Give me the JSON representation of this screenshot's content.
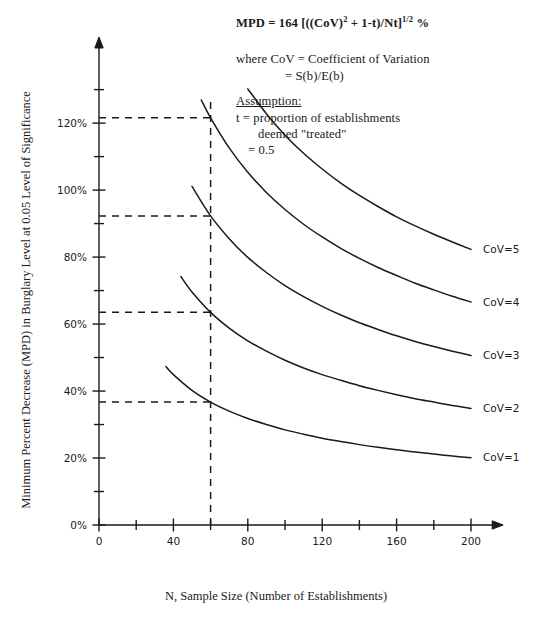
{
  "chart_data": {
    "type": "line",
    "title": "",
    "xlabel": "N, Sample Size (Number of Establishments)",
    "ylabel": "Minimum Percent Decrease (MPD) in Burglary Level at 0.05 Level of Significance",
    "xlim": [
      0,
      215
    ],
    "ylim": [
      0,
      135
    ],
    "grid": false,
    "legend_position": "inline-right-of-curves",
    "x_ticks": [
      0,
      40,
      80,
      120,
      160,
      200
    ],
    "x_tick_labels": [
      "0",
      "40",
      "80",
      "120",
      "160",
      "200"
    ],
    "x_minor_ticks": [
      20,
      60,
      100,
      140,
      180
    ],
    "y_ticks": [
      0,
      20,
      40,
      60,
      80,
      100,
      120
    ],
    "y_tick_labels": [
      "0%",
      "20%",
      "40%",
      "60%",
      "80%",
      "100%",
      "120%"
    ],
    "y_minor_ticks": [
      10,
      30,
      50,
      70,
      90,
      110,
      130
    ],
    "formula": "MPD = 164 * sqrt((CoV^2 + 1 - t) / (N * t))",
    "t_value": 0.5,
    "series": [
      {
        "name": "CoV=1",
        "label": "CoV=1",
        "x": [
          36,
          40,
          50,
          60,
          70,
          80,
          90,
          100,
          110,
          120,
          130,
          140,
          150,
          160,
          170,
          180,
          190,
          200
        ],
        "values": [
          47.3,
          44.9,
          40.2,
          36.7,
          34.0,
          31.8,
          30.0,
          28.4,
          27.1,
          25.9,
          24.9,
          24.0,
          23.2,
          22.5,
          21.8,
          21.2,
          20.6,
          20.1
        ],
        "label_x": 200,
        "label_y": 20.1
      },
      {
        "name": "CoV=2",
        "label": "CoV=2",
        "x": [
          44,
          50,
          60,
          70,
          80,
          90,
          100,
          110,
          120,
          130,
          140,
          150,
          160,
          170,
          180,
          190,
          200
        ],
        "values": [
          74.2,
          69.6,
          63.5,
          58.8,
          55.0,
          51.9,
          49.2,
          46.9,
          44.9,
          43.2,
          41.6,
          40.2,
          38.9,
          37.7,
          36.7,
          35.7,
          34.8
        ],
        "label_x": 200,
        "label_y": 34.8
      },
      {
        "name": "CoV=3",
        "label": "CoV=3",
        "x": [
          50,
          60,
          70,
          80,
          90,
          100,
          110,
          120,
          130,
          140,
          150,
          160,
          170,
          180,
          190,
          200
        ],
        "values": [
          101.1,
          92.3,
          85.5,
          79.9,
          75.4,
          71.5,
          68.2,
          65.3,
          62.7,
          60.4,
          58.4,
          56.5,
          54.8,
          53.3,
          51.9,
          50.6
        ],
        "label_x": 200,
        "label_y": 50.6
      },
      {
        "name": "CoV=4",
        "label": "CoV=4",
        "x": [
          55,
          60,
          70,
          80,
          90,
          100,
          110,
          120,
          130,
          140,
          150,
          160,
          170,
          180,
          190,
          200
        ],
        "values": [
          126.9,
          121.6,
          112.6,
          105.3,
          99.3,
          94.2,
          89.8,
          86.0,
          82.6,
          79.6,
          76.9,
          74.5,
          72.2,
          70.2,
          68.3,
          66.6
        ],
        "label_x": 200,
        "label_y": 66.6
      },
      {
        "name": "CoV=5",
        "label": "CoV=5",
        "x": [
          80,
          90,
          100,
          110,
          120,
          130,
          140,
          150,
          160,
          170,
          180,
          190,
          200
        ],
        "values": [
          130.2,
          122.8,
          116.4,
          111.0,
          106.3,
          102.1,
          98.4,
          95.1,
          92.0,
          89.3,
          86.8,
          84.5,
          82.3
        ],
        "label_x": 200,
        "label_y": 82.3
      }
    ],
    "annotations": {
      "vertical_reference": {
        "x": 60,
        "y_from": 0,
        "y_to": 127
      },
      "horizontal_references": [
        {
          "y": 121.6,
          "x_from": 0,
          "x_to": 60,
          "series": "CoV=4"
        },
        {
          "y": 92.3,
          "x_from": 0,
          "x_to": 60,
          "series": "CoV=3"
        },
        {
          "y": 63.5,
          "x_from": 0,
          "x_to": 60,
          "series": "CoV=2"
        },
        {
          "y": 36.7,
          "x_from": 0,
          "x_to": 60,
          "series": "CoV=1"
        }
      ]
    }
  },
  "notes": {
    "formula_lhs": "MPD",
    "formula_eq": "=",
    "formula_rhs_a": "164 [((CoV)",
    "formula_sup2": "2",
    "formula_rhs_b": " + 1-t)/Nt]",
    "formula_sup_half": "1/2",
    "formula_percent": "%",
    "cov_definition": "where CoV  =  Coefficient of Variation",
    "cov_definition_2": "=  S(b)/E(b)",
    "assumption_title": "Assumption:",
    "assumption_line1": "t  =  proportion of establishments",
    "assumption_line2": "deemed \"treated\"",
    "assumption_line3": "=  0.5"
  },
  "axis": {
    "x_title": "N, Sample Size (Number of Establishments)",
    "y_title": "Minimum Percent Decrease (MPD) in Burglary Level at 0.05 Level of Significance"
  }
}
